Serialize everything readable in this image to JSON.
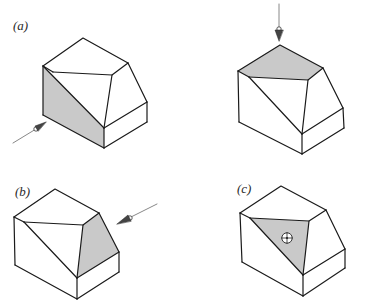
{
  "figure": {
    "colors": {
      "stroke": "#1a1a1a",
      "shade": "#c9c9c9",
      "background": "#ffffff",
      "arrow": "#6a6a6a"
    },
    "panels": [
      {
        "id": "a",
        "label": "(a)",
        "shaded_face": "left-front",
        "viewpoint": "arrow from lower-left"
      },
      {
        "id": "top",
        "label": "",
        "shaded_face": "top",
        "viewpoint": "arrow from above"
      },
      {
        "id": "b",
        "label": "(b)",
        "shaded_face": "right-inclined",
        "viewpoint": "arrow from upper-right"
      },
      {
        "id": "c",
        "label": "(c)",
        "shaded_face": "oblique-triangle",
        "viewpoint": "line of sight into page (target symbol)"
      }
    ]
  }
}
